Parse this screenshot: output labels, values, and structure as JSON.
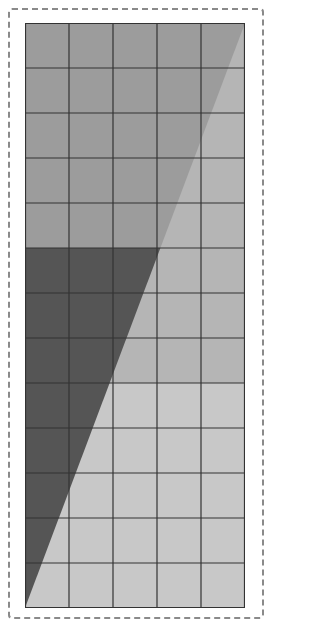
{
  "figure": {
    "grid": {
      "columns": 5,
      "rows": 13,
      "width": 220,
      "height": 585
    },
    "bands": [
      {
        "name": "top",
        "row_start": 0,
        "row_end": 5,
        "left_color": "#9c9c9c",
        "right_color": "#b5b5b5"
      },
      {
        "name": "middle",
        "row_start": 5,
        "row_end": 8,
        "left_color": "#555555",
        "right_color": "#b5b5b5"
      },
      {
        "name": "bottom",
        "row_start": 8,
        "row_end": 13,
        "left_color": "#555555",
        "right_color": "#c8c8c8"
      }
    ],
    "diagonal": {
      "from": [
        0,
        585
      ],
      "to": [
        220,
        0
      ]
    },
    "grid_line_color": "#333333",
    "border_color": "#8a8a8a"
  },
  "watermark": {
    "text": ""
  }
}
